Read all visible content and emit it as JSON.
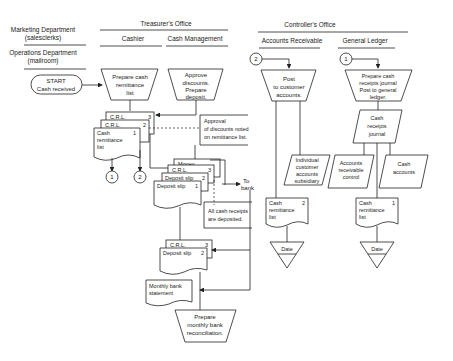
{
  "headers": {
    "marketing": [
      "Marketing Department",
      "(salesclerks)"
    ],
    "operations": [
      "Operations Department",
      "(mailroom)"
    ],
    "treasurer": "Treasurer's Office",
    "cashier": "Cashier",
    "cash_management": "Cash Management",
    "controller": "Controller's Office",
    "accounts_receivable": "Accounts Receivable",
    "general_ledger": "General Ledger"
  },
  "start": [
    "START",
    "Cash received"
  ],
  "prepare_crl": [
    "Prepare cash",
    "remittance",
    "list"
  ],
  "approve": [
    "Approve",
    "discounts.",
    "Prepare",
    "deposit."
  ],
  "crl3": "C.R.L.",
  "crl3_n": "3",
  "crl2": "C.R.L.",
  "crl2_n": "2",
  "crl1": [
    "Cash",
    "remittance",
    "list"
  ],
  "crl1_n": "1",
  "conn1": "1",
  "conn2": "2",
  "approval_note": [
    "Approval",
    "of discounts noted",
    "on remittance list."
  ],
  "money": "Money",
  "crl_b": "C.R.L.",
  "crl_b_n": "3",
  "dep2": "Deposit slip",
  "dep2_n": "2",
  "dep1": "Deposit slip",
  "dep1_n": "1",
  "to_bank": [
    "To",
    "bank"
  ],
  "deposited_note": [
    "All cash receipts",
    "are deposited."
  ],
  "crl_c": "C.R.L.",
  "crl_c_n": "3",
  "dep_c": "Deposit slip",
  "dep_c_n": "2",
  "bank_stmt": [
    "Monthly bank",
    "statement"
  ],
  "reconcile": [
    "Prepare",
    "monthly bank",
    "reconciliation."
  ],
  "post": [
    "Post",
    "to customer",
    "accounts."
  ],
  "subsidiary": [
    "Individual",
    "customer",
    "accounts",
    "subsidiary"
  ],
  "ar_crl": [
    "Cash",
    "remittance",
    "list"
  ],
  "ar_crl_n": "2",
  "date": "Date",
  "journal_proc": [
    "Prepare cash",
    "receipts journal",
    "Post to general",
    "ledger."
  ],
  "journal": [
    "Cash",
    "receipts",
    "journal"
  ],
  "ar_control": [
    "Accounts",
    "receivable",
    "control"
  ],
  "cash_accounts": [
    "Cash",
    "accounts"
  ],
  "gl_crl": [
    "Cash",
    "remittance",
    "list"
  ],
  "gl_crl_n": "1"
}
